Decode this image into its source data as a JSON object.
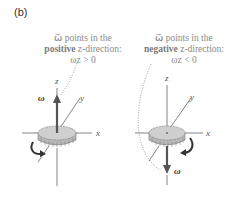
{
  "figure": {
    "panel_label": "(b)",
    "left": {
      "caption_line1": "ω⃗ points in the",
      "caption_bold": "positive",
      "caption_rest": " z-direction:",
      "condition": "ωz > 0",
      "axis_labels": {
        "z": "z",
        "y": "y",
        "x": "x"
      },
      "vector_label": "ω⃗",
      "rotation": "counterclockwise (viewed from above)"
    },
    "right": {
      "caption_line1": "ω⃗ points in the",
      "caption_bold": "negative",
      "caption_rest": " z-direction:",
      "condition": "ωz < 0",
      "axis_labels": {
        "z": "z",
        "y": "y",
        "x": "x"
      },
      "vector_label": "ω⃗",
      "rotation": "clockwise (viewed from above)"
    }
  }
}
